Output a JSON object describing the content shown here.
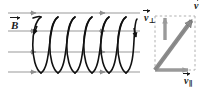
{
  "figure": {
    "background_color": "#ffffff",
    "width": 213,
    "height": 91
  },
  "field": {
    "label": "B",
    "label_subscript": "",
    "description": "uniform magnetic field lines pointing right",
    "line_color": "#9a9a9a",
    "arrow_color": "#8e8e8e",
    "line_count": 4,
    "line_y": [
      13,
      31,
      52,
      72
    ],
    "line_x_start": 8,
    "line_x_end": 140,
    "arrow_x": [
      34,
      104,
      104,
      104
    ]
  },
  "helix": {
    "description": "charged particle spiral trajectory winding around the field lines",
    "color": "#111111",
    "loops": 6,
    "x_start": 33,
    "x_end": 137,
    "center_y": 44,
    "amplitude": 29,
    "loop_half_width": 9,
    "stroke_width": 1.6
  },
  "vector_diagram": {
    "description": "velocity decomposition into parallel and perpendicular components",
    "box": {
      "x": 153,
      "y": 14,
      "width": 44,
      "height": 58
    },
    "dash_color": "#b0b0b0",
    "resultant": {
      "label": "v",
      "subscript": "",
      "color": "#8c8c8c",
      "outline_color": "#6d6d6d",
      "from": [
        155,
        70
      ],
      "to": [
        195,
        16
      ]
    },
    "perpendicular": {
      "label": "v",
      "subscript": "⊥",
      "color": "#9a9a9a",
      "from": [
        165,
        40
      ],
      "to": [
        165,
        16
      ]
    },
    "parallel": {
      "label": "v",
      "subscript": "∥",
      "color": "#9a9a9a",
      "from": [
        155,
        70
      ],
      "to": [
        193,
        70
      ]
    }
  },
  "labels": {
    "field": {
      "symbol": "B",
      "sub": ""
    },
    "v_perpendicular": {
      "symbol": "v",
      "sub": "⊥"
    },
    "v_total": {
      "symbol": "v",
      "sub": ""
    },
    "v_parallel": {
      "symbol": "v",
      "sub": "∥"
    }
  }
}
